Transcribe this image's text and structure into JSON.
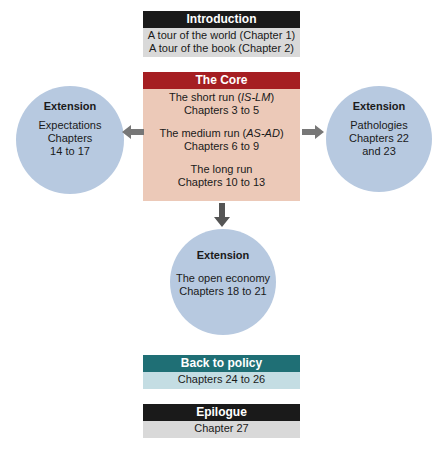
{
  "introduction": {
    "title": "Introduction",
    "lines": [
      "A tour of the world (Chapter 1)",
      "A tour of the book (Chapter 2)"
    ],
    "header_color": "#1a1a1a",
    "body_color": "#d9d9d9"
  },
  "core": {
    "title": "The Core",
    "header_color": "#a51e22",
    "body_color": "#ecc9b8",
    "sections": [
      {
        "prefix": "The short run (",
        "model": "IS-LM",
        "suffix": ")",
        "chapters": "Chapters 3 to 5"
      },
      {
        "prefix": "The medium run (",
        "model": "AS-AD",
        "suffix": ")",
        "chapters": "Chapters 6 to 9"
      },
      {
        "prefix": "The long run",
        "model": "",
        "suffix": "",
        "chapters": "Chapters 10 to 13"
      }
    ]
  },
  "extensions": {
    "left": {
      "title": "Extension",
      "lines": [
        "Expectations",
        "Chapters",
        "14 to 17"
      ]
    },
    "right": {
      "title": "Extension",
      "lines": [
        "Pathologies",
        "Chapters 22",
        "and 23"
      ]
    },
    "bottom": {
      "title": "Extension",
      "lines": [
        "The open economy",
        "Chapters 18 to 21"
      ]
    },
    "circle_color": "#b7c9e0"
  },
  "back_to_policy": {
    "title": "Back to policy",
    "lines": [
      "Chapters 24 to 26"
    ],
    "header_color": "#1f6f75",
    "body_color": "#c4dde3"
  },
  "epilogue": {
    "title": "Epilogue",
    "lines": [
      "Chapter 27"
    ],
    "header_color": "#1a1a1a",
    "body_color": "#d9d9d9"
  },
  "arrow_color": "#777777"
}
